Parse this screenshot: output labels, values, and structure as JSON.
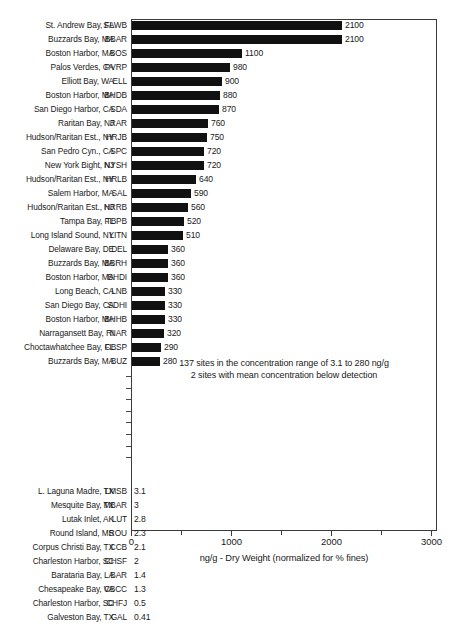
{
  "chart_data": {
    "type": "bar",
    "orientation": "horizontal",
    "title": "",
    "xlabel": "ng/g - Dry Weight (normalized for % fines)",
    "ylabel": "",
    "xlim": [
      0,
      3000
    ],
    "xticks": [
      0,
      1000,
      2000,
      3000
    ],
    "xtick_labels": [
      "0",
      "1000",
      "2000",
      "3000"
    ],
    "minor_xticks": [
      500,
      1500,
      2500
    ],
    "grid": false,
    "legend": null,
    "bar_color": "#111111",
    "categories": [
      "St. Andrew Bay, FL",
      "Buzzards Bay, MA",
      "Boston Harbor, MA",
      "Palos Verdes, CA",
      "Elliott Bay, WA",
      "Boston Harbor, MA",
      "San Diego Harbor, CA",
      "Raritan Bay, NJ",
      "Hudson/Raritan Est., NY",
      "San Pedro Cyn., CA",
      "New York Bight, NJ",
      "Hudson/Raritan Est., NY",
      "Salem Harbor, MA",
      "Hudson/Raritan Est., NJ",
      "Tampa Bay, FL",
      "Long Island Sound, NY",
      "Delaware Bay, DE",
      "Buzzards Bay, MA",
      "Boston Harbor, MA",
      "Long Beach, CA",
      "San Diego Bay, CA",
      "Boston Harbor, MA",
      "Narragansett Bay, RI",
      "Choctawhatchee Bay, FL",
      "Buzzards Bay, MA",
      "L. Laguna Madre, TX",
      "Mesquite Bay, TX",
      "Lutak Inlet, AK",
      "Round Island, MS",
      "Corpus Christi Bay, TX",
      "Charleston Harbor, SC",
      "Barataria Bay, LA",
      "Chesapeake Bay, VA",
      "Charleston Harbor, SC",
      "Galveston Bay, TX"
    ],
    "codes": [
      "SAWB",
      "BBAR",
      "BOS",
      "PVRP",
      "ELL",
      "BHDB",
      "SDA",
      "RAR",
      "HRJB",
      "SPC",
      "NYSH",
      "HRLB",
      "SAL",
      "HRRB",
      "TBPB",
      "LITN",
      "DEL",
      "BBRH",
      "BHDI",
      "LNB",
      "SDHI",
      "BHHB",
      "NAR",
      "CBSP",
      "BUZ",
      "LMSB",
      "MBAR",
      "LUT",
      "ROU",
      "CCB",
      "CHSF",
      "BAR",
      "CBCC",
      "CHFJ",
      "GAL"
    ],
    "values": [
      2100,
      2100,
      1100,
      980,
      900,
      880,
      870,
      760,
      750,
      720,
      720,
      640,
      590,
      560,
      520,
      510,
      360,
      360,
      360,
      330,
      330,
      330,
      320,
      290,
      280,
      3.1,
      3,
      2.8,
      2.3,
      2.1,
      2,
      1.4,
      1.3,
      0.5,
      0.41
    ],
    "value_labels": [
      "2100",
      "2100",
      "1100",
      "980",
      "900",
      "880",
      "870",
      "760",
      "750",
      "720",
      "720",
      "640",
      "590",
      "560",
      "520",
      "510",
      "360",
      "360",
      "360",
      "330",
      "330",
      "330",
      "320",
      "290",
      "280",
      "3.1",
      "3",
      "2.8",
      "2.3",
      "2.1",
      "2",
      "1.4",
      "1.3",
      "0.5",
      "0.41"
    ],
    "annotations": [
      "137 sites in the concentration range of 3.1 to 280 ng/g",
      "2 sites with mean concentration below detection"
    ],
    "break_ticks": 8
  }
}
